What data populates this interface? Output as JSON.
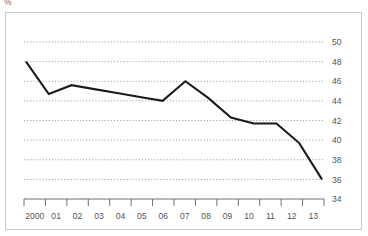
{
  "unit_label": "%",
  "chart_data": {
    "type": "line",
    "title": "",
    "subtitle": "",
    "xlabel": "",
    "ylabel": "%",
    "categories": [
      "2000",
      "01",
      "02",
      "03",
      "04",
      "05",
      "06",
      "07",
      "08",
      "09",
      "10",
      "11",
      "12",
      "13"
    ],
    "values": [
      48.0,
      44.7,
      45.6,
      45.2,
      44.8,
      44.4,
      44.0,
      46.0,
      44.3,
      42.3,
      41.7,
      41.7,
      39.7,
      36.0
    ],
    "series": [
      {
        "name": "",
        "values": [
          48.0,
          44.7,
          45.6,
          45.2,
          44.8,
          44.4,
          44.0,
          46.0,
          44.3,
          42.3,
          41.7,
          41.7,
          39.7,
          36.0
        ]
      }
    ],
    "y_ticks": [
      50,
      48,
      46,
      44,
      42,
      40,
      38,
      36,
      34
    ],
    "ylim": [
      34,
      51
    ],
    "grid": true,
    "grid_style": "dotted-horizontal",
    "legend": "none",
    "y_axis_position": "right",
    "line_color": "#1b1b1b",
    "grid_color": "#8d8d8d",
    "axis_color": "#6f6f6f",
    "frame_color": "#c9c9c9",
    "background_color": "#ffffff"
  }
}
